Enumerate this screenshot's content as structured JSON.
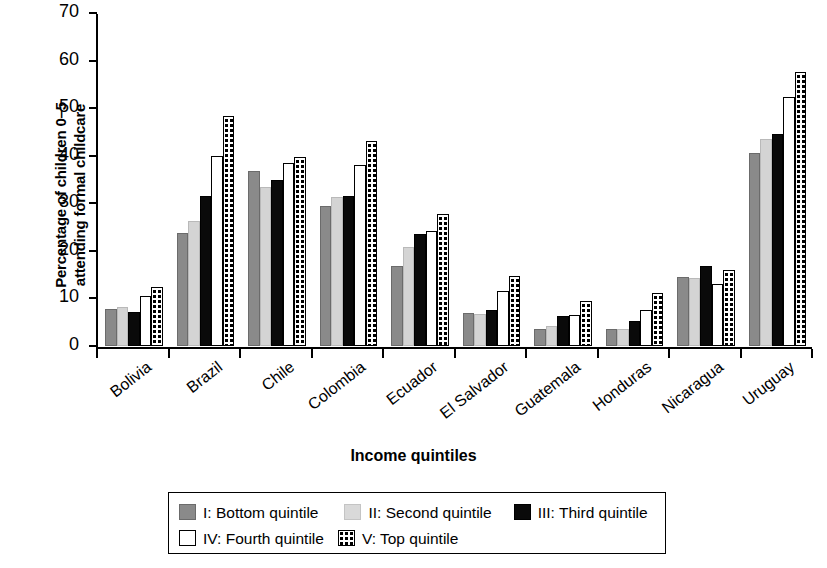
{
  "chart_data": {
    "type": "bar",
    "title": "",
    "xlabel": "Income quintiles",
    "ylabel_line1": "Percentage of children 0–5",
    "ylabel_line2": "attending formal childcare",
    "ylim": [
      0,
      70
    ],
    "yticks": [
      0,
      10,
      20,
      30,
      40,
      50,
      60,
      70
    ],
    "grid": false,
    "legend_position": "below-plot",
    "categories": [
      "Bolivia",
      "Brazil",
      "Chile",
      "Colombia",
      "Ecuador",
      "El Salvador",
      "Guatemala",
      "Honduras",
      "Nicaragua",
      "Uruguay"
    ],
    "series": [
      {
        "name": "I: Bottom quintile",
        "style": "dark-gray",
        "values": [
          7.8,
          23.8,
          36.8,
          29.5,
          16.9,
          7.0,
          3.5,
          3.5,
          14.5,
          40.5
        ]
      },
      {
        "name": "II: Second quintile",
        "style": "light-gray",
        "values": [
          8.2,
          26.2,
          33.5,
          31.4,
          20.8,
          6.8,
          4.2,
          3.6,
          14.3,
          43.6
        ]
      },
      {
        "name": "III: Third quintile",
        "style": "black",
        "values": [
          7.2,
          31.5,
          34.9,
          31.5,
          23.6,
          7.6,
          6.3,
          5.2,
          16.8,
          44.6
        ]
      },
      {
        "name": "IV: Fourth quintile",
        "style": "white",
        "values": [
          10.6,
          39.9,
          38.4,
          38.0,
          24.2,
          11.5,
          6.6,
          7.5,
          13.0,
          52.4
        ]
      },
      {
        "name": "V: Top quintile",
        "style": "checker",
        "values": [
          12.5,
          48.3,
          39.7,
          43.1,
          27.8,
          14.8,
          9.5,
          11.1,
          16.0,
          57.6
        ]
      }
    ]
  },
  "legend": {
    "items": [
      {
        "label": "I: Bottom quintile"
      },
      {
        "label": "II: Second quintile"
      },
      {
        "label": "III: Third quintile"
      },
      {
        "label": "IV: Fourth quintile"
      },
      {
        "label": "V: Top quintile"
      }
    ]
  }
}
